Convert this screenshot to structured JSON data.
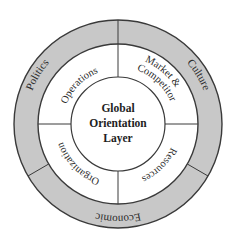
{
  "diagram": {
    "title": "Global Orientation Layer",
    "core": {
      "lines": [
        "Global",
        "Orientation",
        "Layer"
      ]
    },
    "middle_ring": {
      "segments": [
        {
          "label": "Operations",
          "position": "top-left"
        },
        {
          "label_line1": "Market &",
          "label_line2": "Competitor",
          "position": "top-right"
        },
        {
          "label": "Resources",
          "position": "bottom-right"
        },
        {
          "label": "Organization",
          "position": "bottom-left"
        }
      ]
    },
    "outer_ring": {
      "segments": [
        {
          "label": "Politics",
          "position": "left"
        },
        {
          "label": "Culture",
          "position": "right"
        },
        {
          "label": "Economic",
          "position": "bottom"
        }
      ]
    },
    "colors": {
      "outer_ring_fill": "#c8c8c8",
      "middle_ring_fill": "#ffffff",
      "core_fill": "#ffffff",
      "stroke": "#3a3a3a"
    }
  }
}
